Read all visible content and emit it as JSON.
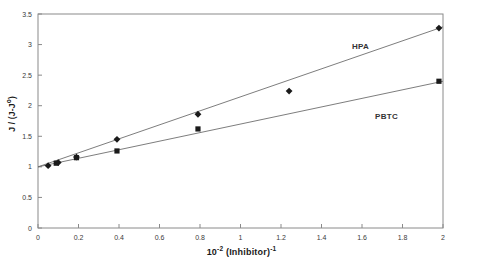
{
  "chart_data": {
    "type": "scatter",
    "title": "",
    "xlabel": "10-2 (Inhibitor)-1",
    "xlabel_base": "10",
    "xlabel_exp1": "-2",
    "xlabel_mid": " (Inhibitor)",
    "xlabel_exp2": "-1",
    "ylabel": "J / (J-J°)",
    "ylabel_base": "J / (J-J",
    "ylabel_exp": "o",
    "ylabel_close": ")",
    "xlim": [
      0,
      2
    ],
    "ylim": [
      0,
      3.5
    ],
    "xticks": [
      0,
      0.2,
      0.4,
      0.6,
      0.8,
      1,
      1.2,
      1.4,
      1.6,
      1.8,
      2
    ],
    "xticklabels": [
      "0",
      "0.2",
      "0.4",
      "0.6",
      "0.8",
      "1",
      "1.2",
      "1.4",
      "1.6",
      "1.8",
      "2"
    ],
    "yticks": [
      0,
      0.5,
      1,
      1.5,
      2,
      2.5,
      3,
      3.5
    ],
    "yticklabels": [
      "0",
      "0.5",
      "1",
      "1.5",
      "2",
      "2.5",
      "3",
      "3.5"
    ],
    "grid": false,
    "legend": "inline-annotations",
    "series": [
      {
        "name": "HPA",
        "marker": "diamond",
        "color": "#1a1a1a",
        "points": [
          {
            "x": 0.05,
            "y": 1.02
          },
          {
            "x": 0.1,
            "y": 1.07
          },
          {
            "x": 0.19,
            "y": 1.16
          },
          {
            "x": 0.39,
            "y": 1.45
          },
          {
            "x": 0.79,
            "y": 1.86
          },
          {
            "x": 1.24,
            "y": 2.24
          },
          {
            "x": 1.98,
            "y": 3.27
          }
        ],
        "fit_line": {
          "x0": 0.0,
          "y0": 1.0,
          "x1": 2.0,
          "y1": 3.29
        }
      },
      {
        "name": "PBTC",
        "marker": "square",
        "color": "#1a1a1a",
        "points": [
          {
            "x": 0.09,
            "y": 1.06
          },
          {
            "x": 0.19,
            "y": 1.15
          },
          {
            "x": 0.39,
            "y": 1.26
          },
          {
            "x": 0.79,
            "y": 1.62
          },
          {
            "x": 1.98,
            "y": 2.4
          }
        ],
        "fit_line": {
          "x0": 0.0,
          "y0": 1.0,
          "x1": 2.0,
          "y1": 2.4
        }
      }
    ],
    "annotations": [
      {
        "text": "HPA",
        "x": 1.55,
        "y": 3.05
      },
      {
        "text": "PBTC",
        "x": 1.66,
        "y": 1.9
      }
    ]
  }
}
